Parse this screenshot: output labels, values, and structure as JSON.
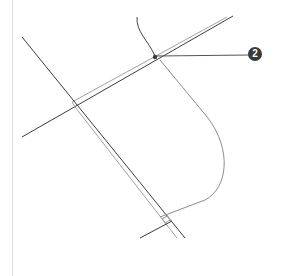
{
  "diagram": {
    "type": "intersection-schematic",
    "callouts": [
      {
        "label": "2",
        "color": "#3a3a3a",
        "x": 255,
        "y": 54
      }
    ],
    "colors": {
      "road_dark": "#3c3c3c",
      "road_light": "#9a9a9a",
      "curve": "#8c8c8c",
      "border": "#dcdcdc",
      "badge_bg": "#3a3a3a"
    }
  }
}
